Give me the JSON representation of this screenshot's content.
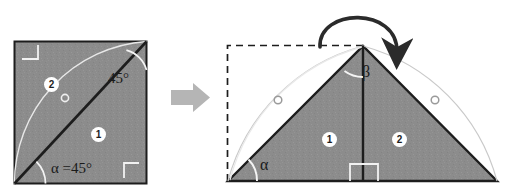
{
  "figure": {
    "background_color": "#ffffff",
    "fill_color": "#8c8c8c",
    "stroke_color": "#1d1d1d",
    "light_stroke_color": "#ffffff",
    "arrow_color": "#b3b3b3",
    "left_panel": {
      "name": "square-with-diagonal",
      "labels": {
        "angle_top": "45°",
        "angle_bottom": "α =45°"
      },
      "pieces": [
        {
          "id": "1",
          "label": "1"
        },
        {
          "id": "2",
          "label": "2"
        }
      ],
      "right_angle_marks": 2,
      "arc_marks": 2,
      "circle_marks": 1
    },
    "transform_arrow": {
      "name": "transform-arrow",
      "direction": "right"
    },
    "right_panel": {
      "name": "triangle-result",
      "labels": {
        "apex_angle": "β",
        "base_angle": "α"
      },
      "pieces": [
        {
          "id": "1",
          "label": "1"
        },
        {
          "id": "2",
          "label": "2"
        }
      ],
      "right_angle_marks": 1,
      "arc_marks": 2,
      "circle_marks": 2,
      "dashed_outline": true,
      "rotation_arrow": true
    }
  }
}
